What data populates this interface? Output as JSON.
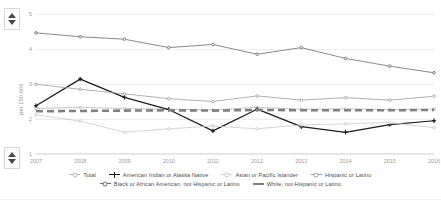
{
  "widget": {
    "scroll_up_icon": "triangle-up-icon",
    "scroll_down_icon": "triangle-down-icon"
  },
  "chart_data": {
    "type": "line",
    "title": "",
    "xlabel": "",
    "ylabel": "per 100,000",
    "grid": true,
    "legend_position": "bottom",
    "ylim": [
      1,
      5
    ],
    "yticks": [
      "5",
      "4",
      "3",
      "2",
      "1"
    ],
    "ytick_values": [
      5,
      4,
      3,
      2,
      1
    ],
    "categories": [
      "2007",
      "2008",
      "2009",
      "2010",
      "2011",
      "2012",
      "2013",
      "2014",
      "2015",
      "2016"
    ],
    "series": [
      {
        "name": "Total",
        "color": "#b4b4b4",
        "marker": "dot",
        "style": "solid",
        "values": [
          2.3,
          2.33,
          2.3,
          2.28,
          2.26,
          2.33,
          2.28,
          2.29,
          2.27,
          2.28
        ]
      },
      {
        "name": "American Indian or Alaska Native",
        "color": "#1d1d1d",
        "marker": "plus",
        "style": "solid",
        "values": [
          2.38,
          3.14,
          2.62,
          2.27,
          1.66,
          2.28,
          1.78,
          1.62,
          1.84,
          1.95
        ]
      },
      {
        "name": "Asian or Pacific Islander",
        "color": "#c9c9c9",
        "marker": "dot",
        "style": "solid",
        "values": [
          2.12,
          1.94,
          1.62,
          1.72,
          1.8,
          1.72,
          1.83,
          1.86,
          1.9,
          1.75
        ]
      },
      {
        "name": "Hispanic or Latino",
        "color": "#a0a0a0",
        "marker": "dot",
        "style": "solid",
        "values": [
          2.99,
          2.85,
          2.72,
          2.58,
          2.5,
          2.66,
          2.54,
          2.61,
          2.54,
          2.65
        ]
      },
      {
        "name": "Black or African American, not Hispanic or Latino",
        "color": "#6d6d6d",
        "marker": "dot",
        "style": "solid",
        "values": [
          4.46,
          4.35,
          4.28,
          4.04,
          4.13,
          3.85,
          4.04,
          3.73,
          3.51,
          3.32
        ]
      },
      {
        "name": "White, not Hispanic or Latino",
        "color": "#808080",
        "marker": "dash",
        "style": "dashed",
        "values": [
          2.22,
          2.23,
          2.24,
          2.25,
          2.24,
          2.26,
          2.25,
          2.25,
          2.25,
          2.26
        ]
      }
    ]
  }
}
